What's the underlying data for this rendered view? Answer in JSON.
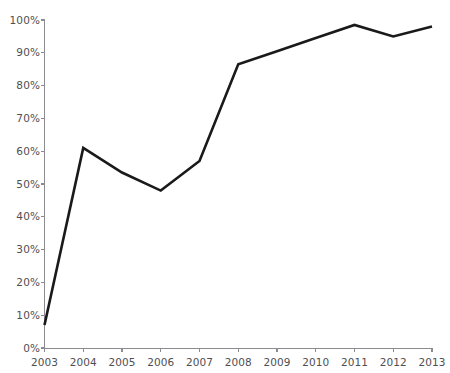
{
  "chart_data": {
    "type": "line",
    "title": "",
    "xlabel": "",
    "ylabel": "",
    "categories": [
      "2003",
      "2004",
      "2005",
      "2006",
      "2007",
      "2008",
      "2009",
      "2010",
      "2011",
      "2012",
      "2013"
    ],
    "values": [
      7,
      61,
      53.5,
      48,
      57,
      86.5,
      90.5,
      94.5,
      98.5,
      95,
      98
    ],
    "series": [
      {
        "name": "",
        "values": [
          7,
          61,
          53.5,
          48,
          57,
          86.5,
          90.5,
          94.5,
          98.5,
          95,
          98
        ],
        "color": "#1a1a1a"
      }
    ],
    "ylim": [
      0,
      100
    ],
    "ytick_values": [
      0,
      10,
      20,
      30,
      40,
      50,
      60,
      70,
      80,
      90,
      100
    ],
    "ytick_labels": [
      "0%",
      "10%",
      "20%",
      "30%",
      "40%",
      "50%",
      "60%",
      "70%",
      "80%",
      "90%",
      "100%"
    ],
    "xtick_labels": [
      "2003",
      "2004",
      "2005",
      "2006",
      "2007",
      "2008",
      "2009",
      "2010",
      "2011",
      "2012",
      "2013"
    ],
    "grid": false,
    "legend": false,
    "legend_position": "none",
    "axis_color": "#8c8c90",
    "label_color": "#4f4f53",
    "background": "#ffffff"
  },
  "axes": {
    "y_labels": [
      "100%",
      "90%",
      "80%",
      "70%",
      "60%",
      "50%",
      "40%",
      "30%",
      "20%",
      "10%",
      "0%"
    ],
    "x_labels": [
      "2003",
      "2004",
      "2005",
      "2006",
      "2007",
      "2008",
      "2009",
      "2010",
      "2011",
      "2012",
      "2013"
    ]
  }
}
